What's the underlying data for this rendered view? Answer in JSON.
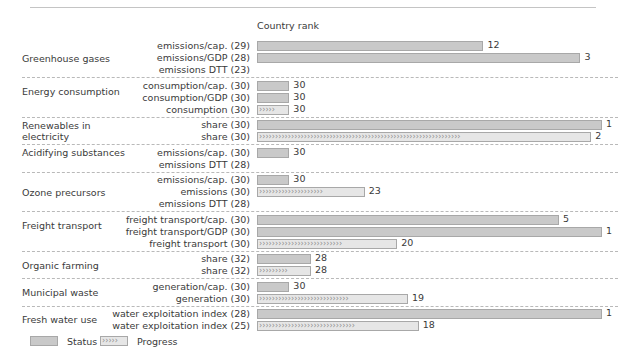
{
  "header": {
    "axis_title": "Country rank"
  },
  "legend": {
    "status_label": "Status",
    "progress_label": "Progress"
  },
  "colors": {
    "status_fill": "#c9c9c9",
    "progress_fill": "#e6e6e6",
    "bar_border": "#a8a8a8",
    "separator": "#b9b9b9",
    "text": "#3a3a3a"
  },
  "chart_data": {
    "type": "bar",
    "title": "",
    "xlabel": "Country rank",
    "ylabel": "",
    "xlim": [
      33,
      1
    ],
    "grid": false,
    "legend_position": "bottom-left",
    "note": "Bar length increases as country rank improves (rank 1 = longest bar). Series 'Status' is a solid bar; series 'Progress' is a chevron-hatched bar.",
    "groups": [
      {
        "group": "Greenhouse gases",
        "rows": [
          {
            "label": "emissions/cap. (29)",
            "series": "Status",
            "value": 12,
            "max_rank": 29
          },
          {
            "label": "emissions/GDP (28)",
            "series": "Status",
            "value": 3,
            "max_rank": 28
          },
          {
            "label": "emissions DTT (23)",
            "series": "Progress",
            "value": null,
            "max_rank": 23
          }
        ]
      },
      {
        "group": "Energy consumption",
        "rows": [
          {
            "label": "consumption/cap. (30)",
            "series": "Status",
            "value": 30,
            "max_rank": 30
          },
          {
            "label": "consumption/GDP (30)",
            "series": "Status",
            "value": 30,
            "max_rank": 30
          },
          {
            "label": "consumption (30)",
            "series": "Progress",
            "value": 30,
            "max_rank": 30
          }
        ]
      },
      {
        "group": "Renewables in electricity",
        "rows": [
          {
            "label": "share (30)",
            "series": "Status",
            "value": 1,
            "max_rank": 30
          },
          {
            "label": "share (30)",
            "series": "Progress",
            "value": 2,
            "max_rank": 30
          }
        ]
      },
      {
        "group": "Acidifying substances",
        "rows": [
          {
            "label": "emissions/cap. (30)",
            "series": "Status",
            "value": 30,
            "max_rank": 30
          },
          {
            "label": "emissions DTT (28)",
            "series": "Progress",
            "value": null,
            "max_rank": 28
          }
        ]
      },
      {
        "group": "Ozone precursors",
        "rows": [
          {
            "label": "emissions/cap. (30)",
            "series": "Status",
            "value": 30,
            "max_rank": 30
          },
          {
            "label": "emissions (30)",
            "series": "Progress",
            "value": 23,
            "max_rank": 30
          },
          {
            "label": "emissions DTT (28)",
            "series": "Progress",
            "value": null,
            "max_rank": 28
          }
        ]
      },
      {
        "group": "Freight transport",
        "rows": [
          {
            "label": "freight transport/cap. (30)",
            "series": "Status",
            "value": 5,
            "max_rank": 30
          },
          {
            "label": "freight transport/GDP (30)",
            "series": "Status",
            "value": 1,
            "max_rank": 30
          },
          {
            "label": "freight transport (30)",
            "series": "Progress",
            "value": 20,
            "max_rank": 30
          }
        ]
      },
      {
        "group": "Organic farming",
        "rows": [
          {
            "label": "share (32)",
            "series": "Status",
            "value": 28,
            "max_rank": 32
          },
          {
            "label": "share (32)",
            "series": "Progress",
            "value": 28,
            "max_rank": 32
          }
        ]
      },
      {
        "group": "Municipal waste",
        "rows": [
          {
            "label": "generation/cap. (30)",
            "series": "Status",
            "value": 30,
            "max_rank": 30
          },
          {
            "label": "generation (30)",
            "series": "Progress",
            "value": 19,
            "max_rank": 30
          }
        ]
      },
      {
        "group": "Fresh water use",
        "rows": [
          {
            "label": "water exploitation index (28)",
            "series": "Status",
            "value": 1,
            "max_rank": 28
          },
          {
            "label": "water exploitation index (25)",
            "series": "Progress",
            "value": 18,
            "max_rank": 25
          }
        ]
      }
    ]
  }
}
